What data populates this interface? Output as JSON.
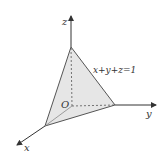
{
  "diagram": {
    "axes": {
      "x_label": "x",
      "y_label": "y",
      "z_label": "z",
      "origin_label": "O"
    },
    "plane_label": "x+y+z=1",
    "colors": {
      "fill": "#e6e6e6",
      "stroke": "#555555",
      "axis": "#333333",
      "text": "#333333"
    }
  }
}
